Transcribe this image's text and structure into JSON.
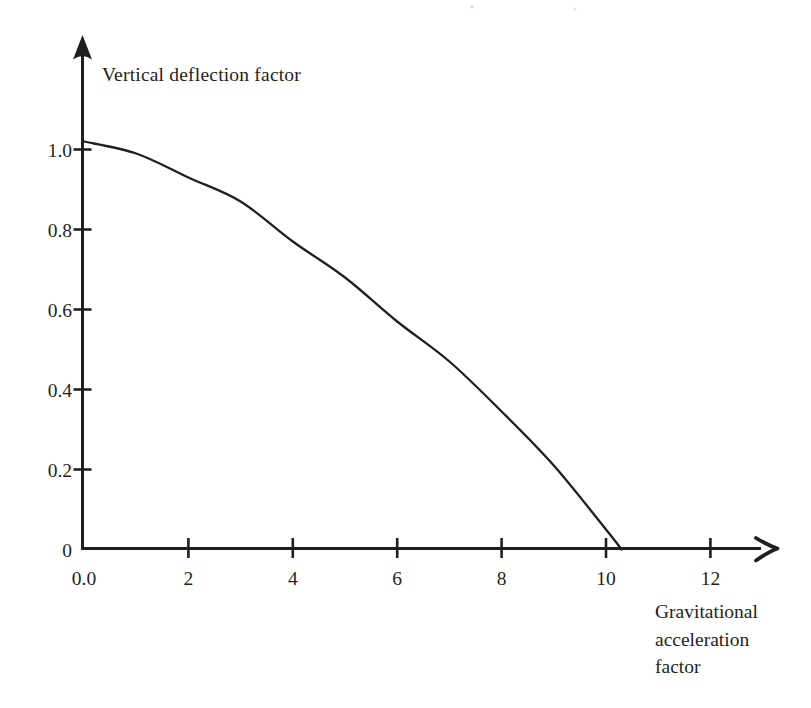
{
  "figure": {
    "background": "#ffffff",
    "ink": "#1f1f1f"
  },
  "chart_data": {
    "type": "line",
    "title": "",
    "ylabel": "Vertical deflection factor",
    "xlabel": "Gravitational acceleration factor",
    "xlabel_lines": [
      "Gravitational",
      "acceleration",
      "factor"
    ],
    "xlim": [
      0,
      13
    ],
    "ylim": [
      0,
      1.26
    ],
    "grid": false,
    "legend": false,
    "x_ticks": [
      {
        "label": "0.0",
        "value": 0,
        "has_tick": false
      },
      {
        "label": "2",
        "value": 2,
        "has_tick": true
      },
      {
        "label": "4",
        "value": 4,
        "has_tick": true
      },
      {
        "label": "6",
        "value": 6,
        "has_tick": true
      },
      {
        "label": "8",
        "value": 8,
        "has_tick": true
      },
      {
        "label": "10",
        "value": 10,
        "has_tick": true
      },
      {
        "label": "12",
        "value": 12,
        "has_tick": true
      }
    ],
    "y_ticks": [
      {
        "label": "0",
        "value": 0,
        "has_tick": false
      },
      {
        "label": "0.2",
        "value": 0.2,
        "has_tick": true
      },
      {
        "label": "0.4",
        "value": 0.4,
        "has_tick": true
      },
      {
        "label": "0.6",
        "value": 0.6,
        "has_tick": true
      },
      {
        "label": "0.8",
        "value": 0.8,
        "has_tick": true
      },
      {
        "label": "1.0",
        "value": 1.0,
        "has_tick": true
      }
    ],
    "series": [
      {
        "name": "vertical-deflection-vs-gravitational-acceleration",
        "x": [
          0,
          1,
          2,
          3,
          4,
          5,
          6,
          7,
          8,
          9,
          10,
          10.3
        ],
        "y": [
          1.02,
          0.99,
          0.93,
          0.87,
          0.77,
          0.68,
          0.57,
          0.47,
          0.345,
          0.21,
          0.05,
          0
        ],
        "y_at_x0": 1.02,
        "x_intercept": 10.3
      }
    ]
  }
}
